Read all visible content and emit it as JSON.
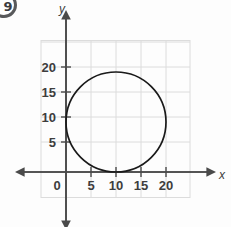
{
  "badge": {
    "label": "9"
  },
  "chart_data": {
    "type": "scatter",
    "title": "",
    "subtitle": "",
    "xlabel": "x",
    "ylabel": "y",
    "xlim": [
      -3,
      25
    ],
    "ylim": [
      -3,
      25
    ],
    "xticks": [
      0,
      5,
      10,
      15,
      20
    ],
    "yticks": [
      5,
      10,
      15,
      20
    ],
    "xtick_labels": [
      "0",
      "5",
      "10",
      "15",
      "20"
    ],
    "ytick_labels": [
      "5",
      "10",
      "15",
      "20"
    ],
    "grid": true,
    "grid_spacing": 5,
    "legend": "none",
    "shapes": [
      {
        "kind": "circle",
        "center_x": 10,
        "center_y": 10,
        "radius": 10,
        "stroke": "#1a1a1a",
        "fill": "none",
        "equation": "(x - 10)^2 + (y - 10)^2 = 100"
      }
    ],
    "annotations": [],
    "colors": {
      "curve": "#1a1a1a",
      "axis": "#4a4a4a",
      "grid": "#d9d9d9",
      "text": "#3d3d3d",
      "background": "#fdfdfd"
    }
  }
}
